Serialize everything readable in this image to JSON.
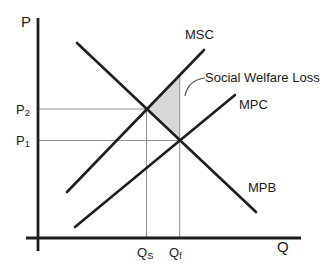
{
  "diagram": {
    "type": "negative-externality-welfare-loss-diagram",
    "axis": {
      "y_label": "P",
      "x_label": "Q"
    },
    "annotation": {
      "welfare_loss": "Social Welfare Loss"
    },
    "curves": {
      "msc": {
        "label": "MSC"
      },
      "mpc": {
        "label": "MPC"
      },
      "mpb": {
        "label": "MPB"
      }
    },
    "prices": {
      "p2": {
        "base": "P",
        "sub": "2"
      },
      "p1": {
        "base": "P",
        "sub": "1"
      }
    },
    "quantities": {
      "qs": {
        "base": "Q",
        "sub": "S"
      },
      "qf": {
        "base": "Q",
        "sub": "f"
      }
    },
    "colors": {
      "curve": "#1e1e1e",
      "reference": "#929292",
      "shade": "#d7d7d7",
      "leader": "#4a4a4a",
      "background": "#ffffff",
      "text": "#1a1a1a"
    },
    "geometry": {
      "lines": {
        "y_axis": [
          38,
          18,
          38,
          251
        ],
        "x_axis": [
          26,
          238,
          301,
          238
        ],
        "p2_ref": [
          39,
          109,
          146.5,
          109
        ],
        "p1_ref": [
          39,
          140.5,
          179.7,
          140.5
        ],
        "qs_ref": [
          146.5,
          109,
          146.5,
          238
        ],
        "qf_ref": [
          179.7,
          74.3,
          179.7,
          238
        ],
        "msc": [
          67,
          192,
          204,
          50
        ],
        "mpc": [
          75,
          227,
          235,
          95
        ],
        "mpb": [
          77,
          43,
          256,
          212
        ]
      },
      "welfare_triangle": [
        [
          146.5,
          109
        ],
        [
          179.7,
          74.3
        ],
        [
          179.7,
          140.5
        ]
      ],
      "leader_path": "M 205 78 Q 188 80 185 96"
    }
  }
}
